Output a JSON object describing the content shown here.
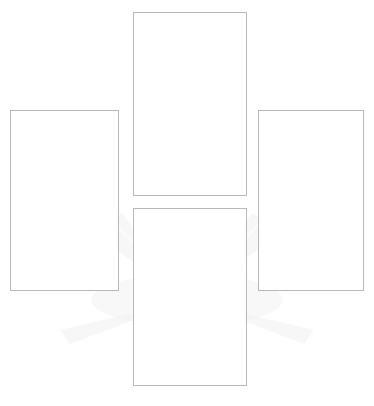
{
  "page": {
    "background_color": "#ffffff",
    "width": 374,
    "height": 406
  },
  "watermark": {
    "name": "sunburst-rays-watermark",
    "color": "#f2f2f3",
    "description": "Very faint light-gray radiating fan / sunburst pattern behind the frames",
    "opacity": "0.55",
    "center_x": 187,
    "center_y": 300,
    "ray_count": 14
  },
  "frames": [
    {
      "id": "frame-top",
      "name": "placeholder-frame-top",
      "position": "top-center",
      "x": 133,
      "y": 12,
      "width": 114,
      "height": 184,
      "border_color": "#b9b9b9",
      "fill_color": "#ffffff",
      "content": ""
    },
    {
      "id": "frame-left",
      "name": "placeholder-frame-left",
      "position": "middle-left",
      "x": 10,
      "y": 110,
      "width": 109,
      "height": 181,
      "border_color": "#b9b9b9",
      "fill_color": "#ffffff",
      "content": ""
    },
    {
      "id": "frame-right",
      "name": "placeholder-frame-right",
      "position": "middle-right",
      "x": 258,
      "y": 110,
      "width": 106,
      "height": 181,
      "border_color": "#b9b9b9",
      "fill_color": "#ffffff",
      "content": ""
    },
    {
      "id": "frame-bottom",
      "name": "placeholder-frame-bottom",
      "position": "bottom-center",
      "x": 133,
      "y": 208,
      "width": 114,
      "height": 178,
      "border_color": "#b9b9b9",
      "fill_color": "#ffffff",
      "content": ""
    }
  ]
}
